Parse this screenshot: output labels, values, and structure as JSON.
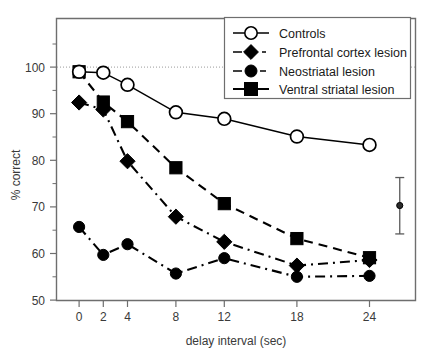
{
  "chart_data": {
    "type": "line",
    "title": "",
    "xlabel": "delay interval (sec)",
    "ylabel": "% correct",
    "x": [
      0,
      2,
      4,
      8,
      12,
      18,
      24
    ],
    "xticklabels": [
      "0",
      "2",
      "4",
      "8",
      "12",
      "18",
      "24"
    ],
    "xlim": [
      -1.9,
      27.8
    ],
    "ylim": [
      50,
      104.5
    ],
    "yticks": [
      50,
      60,
      70,
      80,
      90,
      100
    ],
    "yticklabels": [
      "50",
      "60",
      "70",
      "80",
      "90",
      "100"
    ],
    "yminorticks": [
      55,
      65,
      75,
      85,
      95
    ],
    "grid": false,
    "legend_position": "top-right",
    "reference_line": {
      "y": 100,
      "style": "dotted"
    },
    "series": [
      {
        "name": "Controls",
        "marker": "open-circle",
        "line": "solid",
        "values": [
          99.0,
          98.8,
          96.2,
          90.3,
          88.9,
          85.1,
          83.3
        ]
      },
      {
        "name": "Prefrontal cortex lesion",
        "marker": "filled-diamond",
        "line": "dash-dot",
        "values": [
          92.4,
          90.9,
          79.8,
          67.9,
          62.5,
          57.4,
          58.6
        ]
      },
      {
        "name": "Neostriatal lesion",
        "marker": "filled-circle",
        "line": "dash-dot",
        "values": [
          65.7,
          59.7,
          62.0,
          55.7,
          59.0,
          55.0,
          55.2
        ]
      },
      {
        "name": "Ventral striatal lesion",
        "marker": "filled-square",
        "line": "dashed",
        "values": [
          99.0,
          92.5,
          88.3,
          78.4,
          70.7,
          63.2,
          59.1
        ]
      }
    ],
    "error_bar": {
      "x": 26.5,
      "value": 70.3,
      "lower": 64.2,
      "upper": 76.3,
      "marker": "filled-circle-small"
    }
  },
  "legend": {
    "entries": [
      {
        "label": "Controls"
      },
      {
        "label": "Prefrontal cortex lesion"
      },
      {
        "label": "Neostriatal lesion"
      },
      {
        "label": "Ventral striatal lesion"
      }
    ]
  }
}
